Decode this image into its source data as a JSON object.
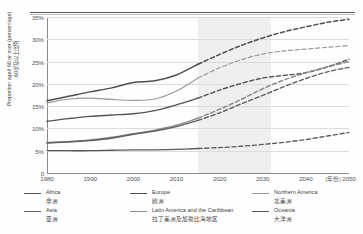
{
  "chart_data": {
    "type": "line",
    "title": "",
    "xlabel": "(年份)",
    "ylabel_en": "Proportion aged 60 or over (percentage)",
    "ylabel_cn": "60岁及以上比例",
    "x": [
      1980,
      1985,
      1990,
      1995,
      2000,
      2005,
      2010,
      2015,
      2020,
      2025,
      2030,
      2035,
      2040,
      2045,
      2050
    ],
    "xlim": [
      1980,
      2050
    ],
    "ylim": [
      0,
      35
    ],
    "ytick_labels": [
      "0",
      "5%",
      "10%",
      "15%",
      "20%",
      "25%",
      "30%",
      "35%"
    ],
    "ytick_values": [
      0,
      5,
      10,
      15,
      20,
      25,
      30,
      35
    ],
    "xtick_labels": [
      "1980",
      "1990",
      "2000",
      "2010",
      "2020",
      "2030",
      "2040",
      "2050"
    ],
    "xtick_values": [
      1980,
      1990,
      2000,
      2010,
      2020,
      2030,
      2040,
      2050
    ],
    "grid": "horizontal",
    "legend_position": "below",
    "projection_start": 2015,
    "shaded_band": {
      "from": 2015,
      "to": 2032,
      "color": "#ececec"
    },
    "series": [
      {
        "name": "Europe",
        "name_cn": "欧洲",
        "color": "#4f4f4f",
        "width": 1.5,
        "values": [
          16.2,
          17.2,
          18.2,
          19.1,
          20.3,
          20.7,
          22.0,
          24.4,
          26.6,
          28.6,
          30.3,
          31.7,
          32.8,
          33.8,
          34.5
        ]
      },
      {
        "name": "Northern America",
        "name_cn": "北美洲",
        "color": "#9a9a9a",
        "width": 1.2,
        "values": [
          15.7,
          16.6,
          16.8,
          16.5,
          16.3,
          16.6,
          18.4,
          21.3,
          23.6,
          25.4,
          26.7,
          27.4,
          27.8,
          28.2,
          28.6
        ]
      },
      {
        "name": "Oceania",
        "name_cn": "大洋洲",
        "color": "#545454",
        "width": 1.4,
        "values": [
          11.6,
          12.2,
          12.7,
          13.0,
          13.3,
          14.0,
          15.3,
          16.8,
          18.6,
          20.1,
          21.3,
          21.9,
          22.5,
          23.8,
          25.5
        ]
      },
      {
        "name": "Latin America and the Caribbean",
        "name_cn": "拉丁美洲及加勒比海地区",
        "color": "#8c8c8c",
        "width": 1.5,
        "values": [
          6.7,
          7.0,
          7.4,
          8.0,
          8.8,
          9.6,
          10.7,
          12.3,
          14.3,
          16.5,
          18.9,
          20.9,
          22.5,
          23.8,
          25.0
        ]
      },
      {
        "name": "Asia",
        "name_cn": "亚洲",
        "color": "#5e5e5e",
        "width": 1.4,
        "values": [
          6.8,
          7.0,
          7.3,
          7.8,
          8.7,
          9.4,
          10.4,
          11.8,
          13.5,
          15.5,
          17.4,
          19.4,
          21.2,
          22.7,
          23.7
        ]
      },
      {
        "name": "Africa",
        "name_cn": "非洲",
        "color": "#5a5a5a",
        "width": 1.3,
        "values": [
          5.0,
          5.0,
          5.0,
          5.1,
          5.2,
          5.2,
          5.3,
          5.5,
          5.7,
          6.0,
          6.4,
          6.9,
          7.5,
          8.3,
          9.1
        ]
      }
    ]
  },
  "legend": {
    "columns": [
      {
        "items": [
          {
            "en": "Africa",
            "cn": "非洲",
            "color": "#5a5a5a",
            "width": 1.5
          },
          {
            "en": "Asia",
            "cn": "亚洲",
            "color": "#5e5e5e",
            "width": 1.4
          }
        ]
      },
      {
        "items": [
          {
            "en": "Europe",
            "cn": "欧洲",
            "color": "#4f4f4f",
            "width": 1.6
          },
          {
            "en": "Latin America and the Caribbean",
            "cn": "拉丁美洲及加勒比海地区",
            "color": "#8c8c8c",
            "width": 1.5
          }
        ]
      },
      {
        "items": [
          {
            "en": "Northern America",
            "cn": "北美洲",
            "color": "#9a9a9a",
            "width": 1.1
          },
          {
            "en": "Oceania",
            "cn": "大洋洲",
            "color": "#545454",
            "width": 1.6
          }
        ]
      }
    ]
  }
}
